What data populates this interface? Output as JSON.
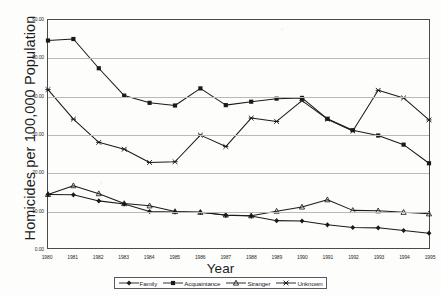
{
  "chart_data": {
    "type": "line",
    "title": "",
    "xlabel": "Year",
    "ylabel": "Homicides per 100,000 Population",
    "xlim": [
      1980,
      1995
    ],
    "ylim": [
      0.0,
      60.0
    ],
    "ytick_labels": [
      "60.00",
      "50.00",
      "40.00",
      "30.00",
      "20.00",
      "10.00",
      "0.00"
    ],
    "ytick_values": [
      60,
      50,
      40,
      30,
      20,
      10,
      0
    ],
    "grid": true,
    "legend_position": "bottom",
    "categories": [
      1980,
      1981,
      1982,
      1983,
      1984,
      1985,
      1986,
      1987,
      1988,
      1989,
      1990,
      1991,
      1992,
      1993,
      1994,
      1995
    ],
    "x": [
      "1980",
      "1981",
      "1982",
      "1983",
      "1984",
      "1985",
      "1986",
      "1987",
      "1988",
      "1989",
      "1990",
      "1991",
      "1992",
      "1993",
      "1994",
      "1995"
    ],
    "series": [
      {
        "name": "Family",
        "marker": "diamond",
        "color": "#1a1a1a",
        "values": [
          14.1,
          14.0,
          12.4,
          11.6,
          9.6,
          9.5,
          9.4,
          8.6,
          8.4,
          7.2,
          7.1,
          6.1,
          5.4,
          5.3,
          4.6,
          3.9
        ]
      },
      {
        "name": "Acquaintance",
        "marker": "square",
        "color": "#1a1a1a",
        "values": [
          54.6,
          55.0,
          47.3,
          40.1,
          38.2,
          37.5,
          42.0,
          37.6,
          38.5,
          39.3,
          39.5,
          34.0,
          31.0,
          29.6,
          27.2,
          22.3
        ]
      },
      {
        "name": "Stranger",
        "marker": "triangle",
        "color": "#1a1a1a",
        "values": [
          14.1,
          16.4,
          14.3,
          11.7,
          11.1,
          9.6,
          9.4,
          8.7,
          8.5,
          9.7,
          10.8,
          12.7,
          9.9,
          9.8,
          9.4,
          9.0
        ]
      },
      {
        "name": "Unknown",
        "marker": "cross",
        "color": "#1a1a1a",
        "values": [
          41.7,
          33.9,
          27.8,
          26.0,
          22.5,
          22.7,
          29.7,
          26.7,
          34.2,
          33.3,
          38.8,
          33.9,
          30.8,
          41.5,
          39.5,
          33.7
        ]
      }
    ]
  },
  "legend": {
    "items": [
      {
        "label": "Family",
        "marker": "diamond"
      },
      {
        "label": "Acquaintance",
        "marker": "square"
      },
      {
        "label": "Stranger",
        "marker": "triangle"
      },
      {
        "label": "Unknown",
        "marker": "cross"
      }
    ]
  }
}
